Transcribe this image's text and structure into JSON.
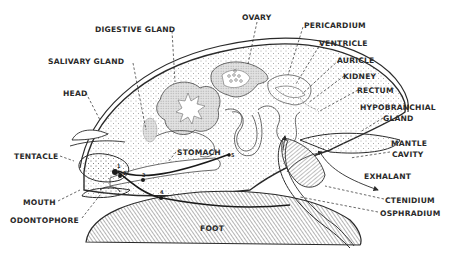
{
  "diagram": {
    "labels": [
      {
        "id": "digestive-gland",
        "text": "DIGESTIVE GLAND",
        "x": 95,
        "y": 25
      },
      {
        "id": "ovary",
        "text": "OVARY",
        "x": 242,
        "y": 13
      },
      {
        "id": "pericardium",
        "text": "PERICARDIUM",
        "x": 304,
        "y": 21
      },
      {
        "id": "ventricle",
        "text": "VENTRICLE",
        "x": 319,
        "y": 39
      },
      {
        "id": "auricle",
        "text": "AURICLE",
        "x": 337,
        "y": 56
      },
      {
        "id": "kidney",
        "text": "KIDNEY",
        "x": 343,
        "y": 72
      },
      {
        "id": "rectum",
        "text": "RECTUM",
        "x": 357,
        "y": 86
      },
      {
        "id": "salivary-gland",
        "text": "SALIVARY  GLAND",
        "x": 48,
        "y": 57
      },
      {
        "id": "hypobranchial-gland-1",
        "text": "HYPOBRANCHIAL",
        "x": 360,
        "y": 103
      },
      {
        "id": "hypobranchial-gland-2",
        "text": "GLAND",
        "x": 383,
        "y": 114
      },
      {
        "id": "head",
        "text": "HEAD",
        "x": 63,
        "y": 89
      },
      {
        "id": "mantle-cavity-1",
        "text": "MANTLE",
        "x": 391,
        "y": 139
      },
      {
        "id": "mantle-cavity-2",
        "text": "CAVITY",
        "x": 392,
        "y": 150
      },
      {
        "id": "tentacle",
        "text": "TENTACLE",
        "x": 14,
        "y": 152
      },
      {
        "id": "stomach",
        "text": "STOMACH",
        "x": 177,
        "y": 148
      },
      {
        "id": "exhalant",
        "text": "EXHALANT",
        "x": 364,
        "y": 172
      },
      {
        "id": "mouth",
        "text": "MOUTH",
        "x": 23,
        "y": 198
      },
      {
        "id": "ctenidium",
        "text": "CTENIDIUM",
        "x": 385,
        "y": 196
      },
      {
        "id": "osphradium",
        "text": "OSPHRADIUM",
        "x": 380,
        "y": 209
      },
      {
        "id": "odontophore",
        "text": "ODONTOPHORE",
        "x": 10,
        "y": 216
      },
      {
        "id": "foot",
        "text": "FOOT",
        "x": 200,
        "y": 224
      }
    ],
    "ganglion_numbers": [
      {
        "text": "1",
        "x": 117,
        "y": 169
      },
      {
        "text": "2",
        "x": 123,
        "y": 175
      },
      {
        "text": "3",
        "x": 142,
        "y": 174
      },
      {
        "text": "4",
        "x": 160,
        "y": 190
      },
      {
        "text": "5",
        "x": 228,
        "y": 153
      }
    ],
    "colors": {
      "ink": "#2a2a2a",
      "stipple": "#555555",
      "organ_fill": "#d8d8d8",
      "background": "#ffffff"
    }
  }
}
